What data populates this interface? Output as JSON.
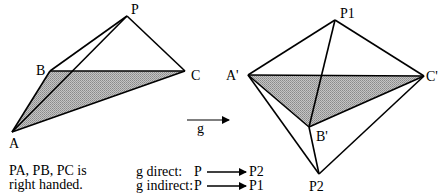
{
  "figure": {
    "left": {
      "vertices": {
        "P": {
          "label": "P",
          "x": 127,
          "y": 16
        },
        "B": {
          "label": "B",
          "x": 50,
          "y": 71
        },
        "C": {
          "label": "C",
          "x": 185,
          "y": 71
        },
        "A": {
          "label": "A",
          "x": 12,
          "y": 132
        }
      },
      "shaded_face": "ABC",
      "caption_line1": "PA, PB, PC is",
      "caption_line2": "right handed."
    },
    "transform_arrow": {
      "label": "g"
    },
    "right": {
      "vertices": {
        "P1": {
          "label": "P1",
          "x": 335,
          "y": 20
        },
        "A'": {
          "label": "A'",
          "x": 248,
          "y": 75
        },
        "C'": {
          "label": "C'",
          "x": 424,
          "y": 76
        },
        "B'": {
          "label": "B'",
          "x": 309,
          "y": 127
        },
        "P2": {
          "label": "P2",
          "x": 319,
          "y": 174
        }
      },
      "shaded_face": "A'B'C'"
    },
    "legend": {
      "direct": {
        "label": "g direct:",
        "from": "P",
        "to": "P2"
      },
      "indirect": {
        "label": "g indirect:",
        "from": "P",
        "to": "P1"
      }
    },
    "colors": {
      "line": "#000000",
      "shade": "#a8a8a8",
      "background": "#ffffff"
    }
  }
}
